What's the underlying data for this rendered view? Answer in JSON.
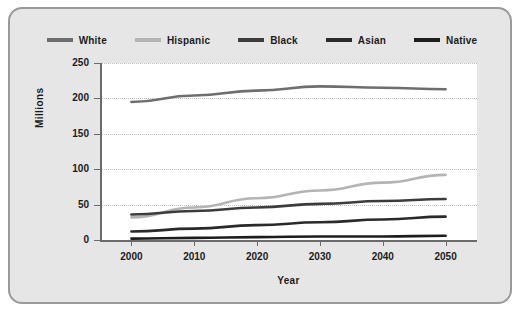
{
  "chart_data": {
    "type": "line",
    "title": "",
    "xlabel": "Year",
    "ylabel": "Millions",
    "x": [
      2000,
      2010,
      2020,
      2030,
      2040,
      2050
    ],
    "xlim": [
      1995,
      2055
    ],
    "ylim": [
      0,
      250
    ],
    "yticks": [
      0,
      50,
      100,
      150,
      200,
      250
    ],
    "xticks": [
      2000,
      2010,
      2020,
      2030,
      2040,
      2050
    ],
    "grid": true,
    "legend_position": "top-center",
    "series": [
      {
        "name": "White",
        "color": "#6e6e6e",
        "values": [
          195,
          204,
          211,
          217,
          215,
          213
        ]
      },
      {
        "name": "Hispanic",
        "color": "#b4b4b4",
        "values": [
          32,
          46,
          59,
          70,
          81,
          92
        ]
      },
      {
        "name": "Black",
        "color": "#3c3c3c",
        "values": [
          36,
          41,
          46,
          51,
          55,
          58
        ]
      },
      {
        "name": "Asian",
        "color": "#2a2a2a",
        "values": [
          12,
          16,
          21,
          25,
          29,
          33
        ]
      },
      {
        "name": "Native",
        "color": "#1c1c1c",
        "values": [
          2,
          3,
          4,
          5,
          5,
          6
        ]
      }
    ]
  },
  "legend": {
    "items": [
      {
        "label": "White"
      },
      {
        "label": "Hispanic"
      },
      {
        "label": "Black"
      },
      {
        "label": "Asian"
      },
      {
        "label": "Native"
      }
    ]
  },
  "axes": {
    "y_tick_labels": [
      "250",
      "200",
      "150",
      "100",
      "50",
      "0"
    ],
    "x_tick_labels": [
      "2000",
      "2010",
      "2020",
      "2030",
      "2040",
      "2050"
    ],
    "y_title": "Millions",
    "x_title": "Year"
  },
  "colors": {
    "card_background": "#e6e6e6",
    "card_border": "#9a9a9a",
    "plot_background": "#ffffff",
    "axis": "#6b6b6b",
    "gridline": "#c2c2c2",
    "text": "#1c1c1c"
  }
}
